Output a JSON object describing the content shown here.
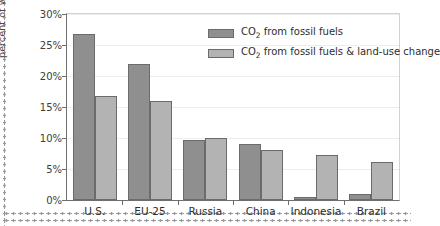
{
  "chart_data": {
    "type": "bar",
    "title": "",
    "subtitle": "",
    "xlabel": "",
    "ylabel": "percent of world total",
    "ylim": [
      0,
      30
    ],
    "ytick_values": [
      0,
      5,
      10,
      15,
      20,
      25,
      30
    ],
    "ytick_labels": [
      "0%",
      "5%",
      "10%",
      "15%",
      "20%",
      "25%",
      "30%"
    ],
    "grid": true,
    "grid_axis": "y",
    "legend_position": "upper right inside",
    "categories": [
      "U.S.",
      "EU-25",
      "Russia",
      "China",
      "Indonesia",
      "Brazil"
    ],
    "series": [
      {
        "name": "CO2 from fossil fuels",
        "label_html": "CO<sub>2</sub> from fossil fuels",
        "color": "#8f8f8f",
        "values": [
          26.7,
          22.0,
          9.6,
          9.1,
          0.5,
          1.0
        ]
      },
      {
        "name": "CO2 from fossil fuels & land-use change",
        "label_html": "CO<sub>2</sub> from fossil fuels &amp; land-use change",
        "color": "#b3b3b3",
        "values": [
          16.7,
          15.9,
          10.0,
          8.1,
          7.3,
          6.2
        ]
      }
    ],
    "annotations": []
  },
  "legend": {
    "items": [
      {
        "label_prefix": "CO",
        "label_sub": "2",
        "label_rest": " from fossil fuels"
      },
      {
        "label_prefix": "CO",
        "label_sub": "2",
        "label_rest": " from fossil fuels & land-use change"
      }
    ]
  },
  "colors": {
    "series1": "#8f8f8f",
    "series2": "#b3b3b3",
    "bar_outline": "#6b6b6b",
    "axis": "#6e6e6e",
    "gridline": "#ededed",
    "text": "#2e2e2e",
    "background": "#ffffff",
    "dotted_border": "#9a9a9a"
  }
}
